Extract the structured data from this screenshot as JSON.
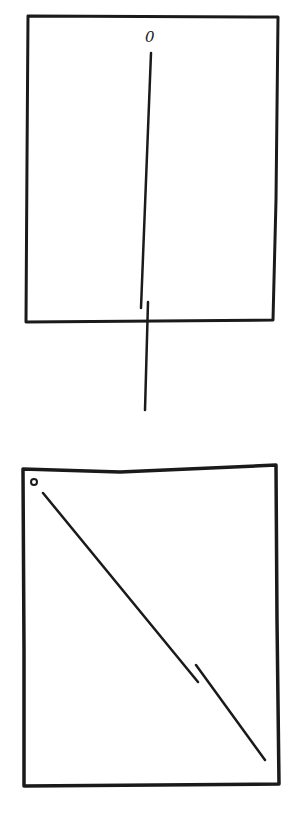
{
  "diagram": {
    "style": "hand-drawn line sketch",
    "stroke_color": "#1a1a1a",
    "background": "#ffffff",
    "panels": [
      {
        "name": "top-panel",
        "description": "Rectangle with near-vertical line through center extending below bottom edge",
        "label": "0",
        "box": {
          "x1": 26,
          "y1": 15,
          "x2": 280,
          "y2": 322
        },
        "lines": [
          {
            "x1": 151,
            "y1": 53,
            "x2": 141,
            "y2": 308
          },
          {
            "x1": 148,
            "y1": 302,
            "x2": 145,
            "y2": 410
          }
        ]
      },
      {
        "name": "bottom-panel",
        "description": "Rectangle with small circle in top-left corner and diagonal line to bottom-right with a small break",
        "marker": "circle",
        "box": {
          "x1": 22,
          "y1": 465,
          "x2": 278,
          "y2": 785
        },
        "circle": {
          "cx": 34,
          "cy": 482,
          "r": 3
        },
        "lines": [
          {
            "x1": 43,
            "y1": 493,
            "x2": 198,
            "y2": 682
          },
          {
            "x1": 196,
            "y1": 665,
            "x2": 265,
            "y2": 760
          }
        ]
      }
    ]
  }
}
